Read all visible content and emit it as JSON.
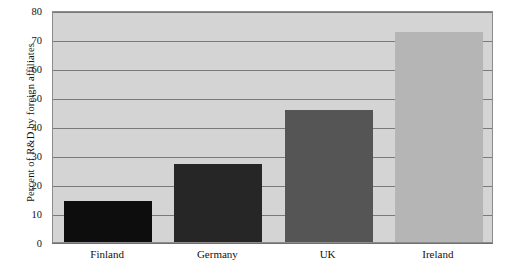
{
  "chart_data": {
    "type": "bar",
    "title": "",
    "subtitle": "",
    "xlabel": "",
    "ylabel": "Percent of R&D by foreign affiliates",
    "categories": [
      "Finland",
      "Germany",
      "UK",
      "Ireland"
    ],
    "values": [
      14,
      27,
      45.5,
      72.5
    ],
    "series": [
      {
        "name": "Percent of R&D by foreign affiliates",
        "values": [
          14,
          27,
          45.5,
          72.5
        ]
      }
    ],
    "ylim": [
      0,
      80
    ],
    "xlim": [
      0,
      4
    ],
    "ytick_labels": [
      "0",
      "10",
      "20",
      "30",
      "40",
      "50",
      "60",
      "70",
      "80"
    ],
    "ytick_values": [
      0,
      10,
      20,
      30,
      40,
      50,
      60,
      70,
      80
    ],
    "ytick_interval": 10,
    "grid": {
      "horizontal": true,
      "vertical": false,
      "color": "#7a7a7a"
    },
    "legend": {
      "visible": false,
      "position": "none",
      "entries": []
    },
    "annotations": [],
    "bar_colors": [
      "#0d0d0d",
      "#262626",
      "#555555",
      "#b5b5b5"
    ],
    "plot_background": "#d4d4d4",
    "plot_border_color": "#8c8c8c",
    "axis_text_color": "#111111",
    "figure_background": "#ffffff"
  }
}
